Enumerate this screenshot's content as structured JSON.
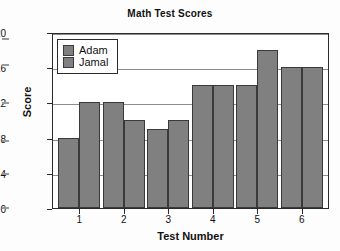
{
  "chart_data": {
    "type": "bar",
    "title": "Math Test Scores",
    "xlabel": "Test Number",
    "ylabel": "Score",
    "categories": [
      "1",
      "2",
      "3",
      "4",
      "5",
      "6"
    ],
    "series": [
      {
        "name": "Adam",
        "values": [
          8,
          12,
          9,
          14,
          14,
          16
        ]
      },
      {
        "name": "Jamal",
        "values": [
          12,
          10,
          10,
          14,
          18,
          16
        ]
      }
    ],
    "ylim": [
      0,
      20
    ],
    "yticks": [
      0,
      4,
      8,
      12,
      16,
      20
    ],
    "grid": true,
    "legend_position": "top-left-inside",
    "bar_color": "#808080",
    "bar_edge_color": "#3a3a3a",
    "frame_color": "#2a2a2a",
    "gridline_color": "#8d8d8d",
    "plot_background": "#ffffff",
    "figure_background": "#fdfdfd"
  },
  "legend": {
    "entries": [
      {
        "label": "Adam"
      },
      {
        "label": "Jamal"
      }
    ]
  }
}
